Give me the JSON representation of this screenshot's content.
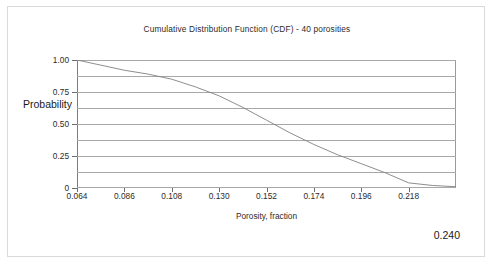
{
  "chart_data": {
    "type": "line",
    "title": "Cumulative Distribution Function (CDF) - 40 porosities",
    "xlabel": "Porosity, fraction",
    "ylabel": "Probability",
    "xlim": [
      0.064,
      0.24
    ],
    "ylim": [
      0,
      1.0
    ],
    "grid": true,
    "legend": null,
    "x_tick_labels": [
      "0.064",
      "0.086",
      "0.108",
      "0.130",
      "0.152",
      "0.174",
      "0.196",
      "0.218"
    ],
    "x_tick_values": [
      0.064,
      0.086,
      0.108,
      0.13,
      0.152,
      0.174,
      0.196,
      0.218
    ],
    "y_tick_labels": [
      "1.00",
      "0.75",
      "0.50",
      "0.25",
      "0"
    ],
    "y_tick_values": [
      1.0,
      0.75,
      0.5,
      0.25,
      0
    ],
    "gridline_values": [
      1.0,
      0.875,
      0.75,
      0.625,
      0.5,
      0.375,
      0.25,
      0.125,
      0
    ],
    "series": [
      {
        "name": "CDF",
        "color": "#808080",
        "x": [
          0.064,
          0.075,
          0.086,
          0.097,
          0.108,
          0.119,
          0.13,
          0.141,
          0.152,
          0.163,
          0.174,
          0.185,
          0.196,
          0.207,
          0.218,
          0.229,
          0.24
        ],
        "y": [
          1.0,
          0.96,
          0.92,
          0.89,
          0.85,
          0.79,
          0.72,
          0.63,
          0.53,
          0.43,
          0.34,
          0.26,
          0.19,
          0.12,
          0.04,
          0.02,
          0.01
        ]
      }
    ],
    "annotation": "0.240"
  },
  "figure": {
    "trailing_label": "0.240"
  }
}
